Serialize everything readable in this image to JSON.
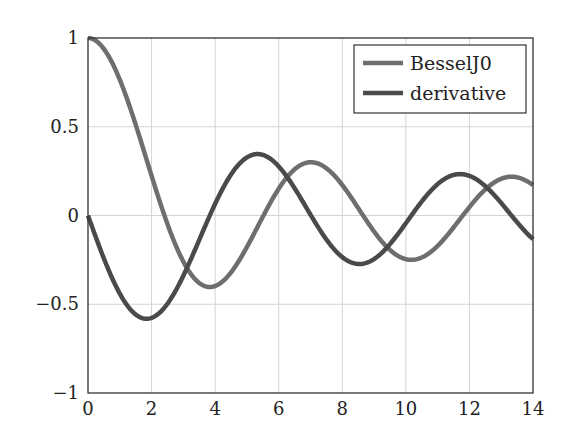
{
  "chart_data": {
    "type": "line",
    "title": "",
    "xlabel": "",
    "ylabel": "",
    "xlim": [
      0,
      14
    ],
    "ylim": [
      -1,
      1
    ],
    "grid": true,
    "legend_position": "top-right",
    "x_ticks": [
      "0",
      "2",
      "4",
      "6",
      "8",
      "10",
      "12",
      "14"
    ],
    "y_ticks": [
      "1",
      "0.5",
      "0",
      "−0.5",
      "−1"
    ],
    "x": [
      0,
      1,
      2,
      3,
      4,
      5,
      6,
      7,
      8,
      9,
      10,
      11,
      12,
      13,
      14
    ],
    "series": [
      {
        "name": "BesselJ0",
        "color": "#6e6e6e",
        "values": [
          1.0,
          0.765,
          0.224,
          -0.26,
          -0.397,
          -0.178,
          0.151,
          0.3,
          0.172,
          -0.09,
          -0.246,
          -0.171,
          0.048,
          0.207,
          0.171
        ]
      },
      {
        "name": "derivative",
        "color": "#4a4a4a",
        "values": [
          0.0,
          -0.44,
          -0.577,
          -0.339,
          0.066,
          0.328,
          0.277,
          -0.005,
          -0.235,
          -0.245,
          -0.043,
          0.177,
          0.223,
          0.07,
          -0.133
        ]
      }
    ]
  },
  "legend": {
    "items": [
      {
        "label": "BesselJ0",
        "color": "#6e6e6e"
      },
      {
        "label": "derivative",
        "color": "#4a4a4a"
      }
    ]
  }
}
